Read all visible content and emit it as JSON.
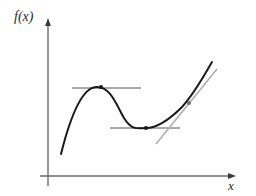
{
  "figure": {
    "title": "",
    "background_color": "#ffffff",
    "axes": {
      "y_axis_label": "f(x)",
      "x_axis_label": "x",
      "axis_color": "#6b6b6b",
      "origin": {
        "x": 48,
        "y": 176
      },
      "y_axis_top": {
        "x": 48,
        "y": 20
      },
      "y_axis_bottom": {
        "x": 48,
        "y": 186
      },
      "x_axis_right": {
        "x": 234,
        "y": 176
      },
      "arrowheads": [
        "y-axis-top",
        "x-axis-right"
      ]
    },
    "curve": {
      "name": "function-curve",
      "color": "#1a1a1a",
      "stroke_width": 2,
      "description": "cubic-like curve with local maximum, local minimum and an inflection point",
      "path": "M 61 154 C 70 118, 82 88, 96 87 C 110 86, 116 104, 124 118 C 132 131, 138 128, 146 128 C 158 128, 170 119, 182 107 C 194 94, 204 76, 212 62"
    },
    "tangents": [
      {
        "name": "tangent-at-maximum",
        "type": "horizontal",
        "color": "#555555",
        "stroke_width": 1,
        "x1": 72,
        "y1": 88,
        "x2": 141,
        "y2": 88,
        "slope": 0
      },
      {
        "name": "tangent-at-minimum",
        "type": "horizontal",
        "color": "#555555",
        "stroke_width": 1,
        "x1": 110,
        "y1": 128,
        "x2": 180,
        "y2": 128,
        "slope": 0
      },
      {
        "name": "tangent-at-inflection",
        "type": "slanted",
        "color": "#b0b0b0",
        "stroke_width": 1.6,
        "x1": 156,
        "y1": 144,
        "x2": 217,
        "y2": 69,
        "slope": "positive"
      }
    ],
    "points": [
      {
        "name": "local-maximum-point",
        "x": 101,
        "y": 87,
        "radius": 2.1,
        "color": "#1a1a1a"
      },
      {
        "name": "local-minimum-point",
        "x": 146,
        "y": 128,
        "radius": 2.1,
        "color": "#1a1a1a"
      },
      {
        "name": "inflection-point",
        "x": 189,
        "y": 103,
        "radius": 2.1,
        "color": "#6f6f6f"
      }
    ]
  }
}
